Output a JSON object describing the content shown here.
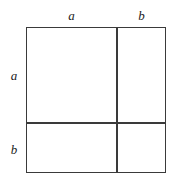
{
  "figure": {
    "name": "binomial-square-diagram",
    "background_color": "#ffffff",
    "line_color": "#3a3a3a",
    "text_color": "#1c1c1c"
  },
  "labels": {
    "top_left": "a",
    "top_right": "b",
    "left_top": "a",
    "left_bottom": "b"
  },
  "chart_data": {
    "type": "diagram",
    "title": "",
    "outer_square": {
      "x": 26,
      "y": 27,
      "width": 140,
      "height": 146
    },
    "dividers": {
      "vertical_x": 117,
      "horizontal_y": 123
    },
    "column_labels": [
      "a",
      "b"
    ],
    "row_labels": [
      "a",
      "b"
    ],
    "column_widths": [
      91,
      49
    ],
    "row_heights": [
      96,
      50
    ],
    "cells": [
      {
        "row": "a",
        "column": "a",
        "area": "a·a"
      },
      {
        "row": "a",
        "column": "b",
        "area": "a·b"
      },
      {
        "row": "b",
        "column": "a",
        "area": "b·a"
      },
      {
        "row": "b",
        "column": "b",
        "area": "b·b"
      }
    ]
  }
}
